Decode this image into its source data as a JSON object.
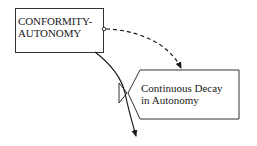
{
  "diagram": {
    "type": "system-dynamics stock-and-flow",
    "level": {
      "line1": "CONFORMITY-",
      "line2": "AUTONOMY"
    },
    "rate": {
      "line1": "Continuous Decay",
      "line2": "in Autonomy"
    },
    "connections": [
      {
        "from": "level",
        "to": "rate",
        "style": "dashed",
        "kind": "information-link"
      },
      {
        "from": "level",
        "to": "sink",
        "style": "solid",
        "kind": "flow",
        "via": "valve"
      }
    ],
    "colors": {
      "ink": "#1a1a1a",
      "background": "#ffffff"
    }
  }
}
